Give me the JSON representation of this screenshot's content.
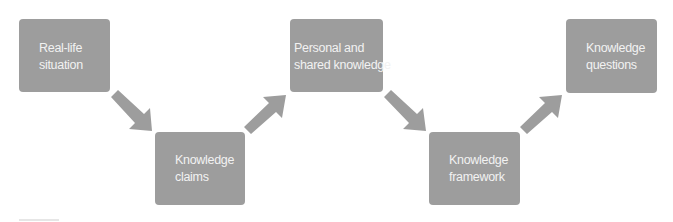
{
  "diagram": {
    "type": "flow",
    "colors": {
      "box": "#9d9d9d",
      "arrow": "#9d9d9d",
      "text": "#f2f2f2",
      "background": "#ffffff"
    },
    "nodes": [
      {
        "id": "n1",
        "line1": "Real-life",
        "line2": "situation"
      },
      {
        "id": "n2",
        "line1": "Knowledge",
        "line2": "claims"
      },
      {
        "id": "n3",
        "line1": "Personal and",
        "line2": "shared knowledge"
      },
      {
        "id": "n4",
        "line1": "Knowledge",
        "line2": "framework"
      },
      {
        "id": "n5",
        "line1": "Knowledge",
        "line2": "questions"
      }
    ],
    "edges": [
      {
        "from": "n1",
        "to": "n2",
        "direction": "down-right"
      },
      {
        "from": "n2",
        "to": "n3",
        "direction": "up-right"
      },
      {
        "from": "n3",
        "to": "n4",
        "direction": "down-right"
      },
      {
        "from": "n4",
        "to": "n5",
        "direction": "up-right"
      }
    ]
  }
}
